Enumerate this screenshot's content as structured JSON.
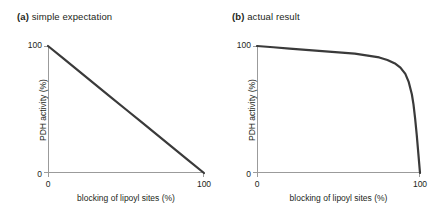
{
  "figure": {
    "panels": [
      {
        "tag": "(a)",
        "title": "simple expectation",
        "ylabel": "PDH activity (%)",
        "xlabel": "blocking of lipoyl sites (%)",
        "y_ticks": [
          "0",
          "100"
        ],
        "x_ticks": [
          "0",
          "100"
        ]
      },
      {
        "tag": "(b)",
        "title": "actual result",
        "ylabel": "PDH activity (%)",
        "xlabel": "blocking of lipoyl sites (%)",
        "y_ticks": [
          "0",
          "100"
        ],
        "x_ticks": [
          "0",
          "100"
        ]
      }
    ]
  },
  "colors": {
    "curve": "#3a3a3a",
    "axis": "#9b9b9b",
    "text": "#231f20",
    "background": "#ffffff"
  },
  "chart_data": [
    {
      "type": "line",
      "title": "simple expectation",
      "xlabel": "blocking of lipoyl sites (%)",
      "ylabel": "PDH activity (%)",
      "xlim": [
        0,
        100
      ],
      "ylim": [
        0,
        100
      ],
      "grid": false,
      "legend": "none",
      "series": [
        {
          "name": "simple expectation",
          "x": [
            0,
            10,
            20,
            30,
            40,
            50,
            60,
            70,
            80,
            90,
            100
          ],
          "y": [
            100,
            90,
            80,
            70,
            60,
            50,
            40,
            30,
            20,
            10,
            0
          ]
        }
      ]
    },
    {
      "type": "line",
      "title": "actual result",
      "xlabel": "blocking of lipoyl sites (%)",
      "ylabel": "PDH activity (%)",
      "xlim": [
        0,
        100
      ],
      "ylim": [
        0,
        100
      ],
      "grid": false,
      "legend": "none",
      "series": [
        {
          "name": "actual result",
          "x": [
            0,
            10,
            20,
            30,
            40,
            50,
            60,
            70,
            75,
            80,
            85,
            88,
            91,
            93,
            95,
            96,
            97,
            98,
            99,
            100
          ],
          "y": [
            100,
            99,
            98,
            97,
            96,
            95,
            94,
            92,
            91,
            89,
            86,
            83,
            78,
            72,
            62,
            54,
            43,
            30,
            15,
            0
          ]
        }
      ]
    }
  ]
}
